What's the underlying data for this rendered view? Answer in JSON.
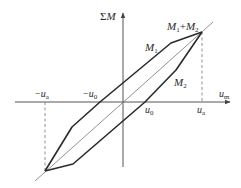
{
  "diagram": {
    "type": "hysteresis-loop",
    "colors": {
      "axis": "#555555",
      "curve": "#2b2b2b",
      "diagonal": "#777777",
      "dashed": "#777777",
      "text": "#2a2a2a"
    },
    "axes": {
      "y_label": {
        "prefix": "Σ",
        "main": "M"
      },
      "x_label": {
        "main": "u",
        "sub": "m"
      },
      "origin": [
        123,
        102
      ]
    },
    "tick_labels": {
      "neg_ua": {
        "sign": "−",
        "main": "u",
        "sub": "a"
      },
      "neg_u0": {
        "sign": "−",
        "main": "u",
        "sub": "0"
      },
      "u0": {
        "main": "u",
        "sub": "0"
      },
      "ua": {
        "main": "u",
        "sub": "a"
      }
    },
    "curve_labels": {
      "m1": {
        "main": "M",
        "sub": "1"
      },
      "m2": {
        "main": "M",
        "sub": "2"
      },
      "sum": {
        "m1": "M",
        "s1": "1",
        "plus": "+",
        "m2": "M",
        "s2": "2"
      }
    },
    "points": {
      "top_vertex": [
        202,
        32
      ],
      "bottom_vertex": [
        45,
        171
      ],
      "m1_upper_bend": [
        171,
        43
      ],
      "m1_lower_bend": [
        72,
        127
      ],
      "m2_upper_bend": [
        176,
        70
      ],
      "m2_lower_bend": [
        73,
        164
      ],
      "neg_u0_cross": [
        100,
        102
      ],
      "u0_cross": [
        145,
        102
      ]
    }
  }
}
